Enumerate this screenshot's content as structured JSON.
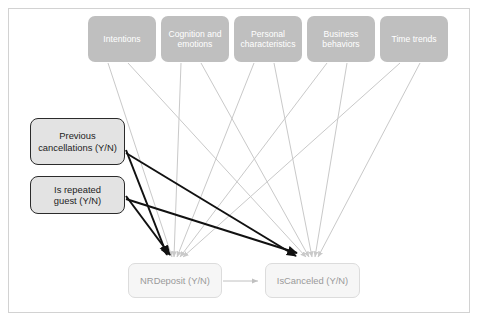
{
  "diagram": {
    "colors": {
      "frame_border": "#d2d2d2",
      "top_node_fill": "#bfbfbf",
      "top_node_text": "#ffffff",
      "left_node_fill": "#e3e3e3",
      "left_node_border": "#2b2b2b",
      "left_node_text": "#1d1d1d",
      "bottom_node_fill": "#f6f6f6",
      "bottom_node_border": "#dcdcdc",
      "bottom_node_text": "#9a9a9a",
      "gray_edge": "#c9c9c9",
      "dark_edge": "#111111"
    },
    "top_nodes": [
      {
        "id": "intentions",
        "label": "Intentions",
        "x": 88,
        "y": 16,
        "w": 68,
        "h": 46
      },
      {
        "id": "cognition-and-emotions",
        "label": "Cognition and\nemotions",
        "x": 161,
        "y": 16,
        "w": 68,
        "h": 46
      },
      {
        "id": "personal-characteristics",
        "label": "Personal\ncharacteristics",
        "x": 234,
        "y": 16,
        "w": 68,
        "h": 46
      },
      {
        "id": "business-behaviors",
        "label": "Business\nbehaviors",
        "x": 307,
        "y": 16,
        "w": 68,
        "h": 46
      },
      {
        "id": "time-trends",
        "label": "Time trends",
        "x": 380,
        "y": 16,
        "w": 68,
        "h": 46
      }
    ],
    "left_nodes": [
      {
        "id": "previous-cancellations",
        "label": "Previous\ncancellations (Y/N)",
        "x": 30,
        "y": 118,
        "w": 95,
        "h": 47
      },
      {
        "id": "is-repeated-guest",
        "label": "Is repeated\nguest (Y/N)",
        "x": 30,
        "y": 176,
        "w": 95,
        "h": 38
      }
    ],
    "bottom_nodes": [
      {
        "id": "nrdeposit",
        "label": "NRDeposit (Y/N)",
        "x": 128,
        "y": 263,
        "w": 94,
        "h": 35
      },
      {
        "id": "iscanceled",
        "label": "IsCanceled (Y/N)",
        "x": 265,
        "y": 263,
        "w": 95,
        "h": 35
      }
    ],
    "edges": [
      {
        "from": "intentions",
        "to": "nrdeposit",
        "style": "gray"
      },
      {
        "from": "intentions",
        "to": "iscanceled",
        "style": "gray"
      },
      {
        "from": "cognition-and-emotions",
        "to": "nrdeposit",
        "style": "gray"
      },
      {
        "from": "cognition-and-emotions",
        "to": "iscanceled",
        "style": "gray"
      },
      {
        "from": "personal-characteristics",
        "to": "nrdeposit",
        "style": "gray"
      },
      {
        "from": "personal-characteristics",
        "to": "iscanceled",
        "style": "gray"
      },
      {
        "from": "business-behaviors",
        "to": "nrdeposit",
        "style": "gray"
      },
      {
        "from": "business-behaviors",
        "to": "iscanceled",
        "style": "gray"
      },
      {
        "from": "time-trends",
        "to": "nrdeposit",
        "style": "gray"
      },
      {
        "from": "time-trends",
        "to": "iscanceled",
        "style": "gray"
      },
      {
        "from": "previous-cancellations",
        "to": "nrdeposit",
        "style": "dark"
      },
      {
        "from": "previous-cancellations",
        "to": "iscanceled",
        "style": "dark"
      },
      {
        "from": "is-repeated-guest",
        "to": "nrdeposit",
        "style": "dark"
      },
      {
        "from": "is-repeated-guest",
        "to": "iscanceled",
        "style": "dark"
      },
      {
        "from": "nrdeposit",
        "to": "iscanceled",
        "style": "gray"
      }
    ]
  }
}
